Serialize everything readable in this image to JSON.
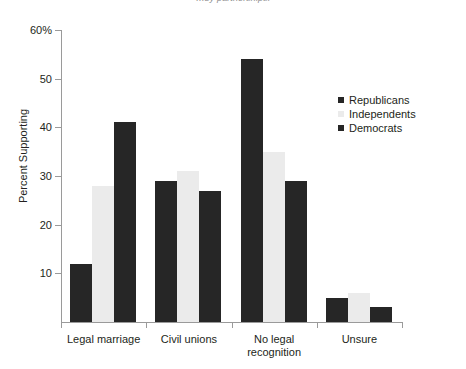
{
  "caption_fragment": "…by partnerships.",
  "chart_data": {
    "type": "bar",
    "title": "",
    "xlabel": "",
    "ylabel": "Percent Supporting",
    "ylim": [
      0,
      60
    ],
    "grid": false,
    "legend_position": "upper-right-inside",
    "categories": [
      "Legal marriage",
      "Civil unions",
      "No legal\nrecognition",
      "Unsure"
    ],
    "category_lines": [
      [
        "Legal marriage"
      ],
      [
        "Civil unions"
      ],
      [
        "No legal",
        "recognition"
      ],
      [
        "Unsure"
      ]
    ],
    "ytick_labels": [
      "60%",
      "50",
      "40",
      "30",
      "20",
      "10"
    ],
    "ytick_values": [
      60,
      50,
      40,
      30,
      20,
      10
    ],
    "series": [
      {
        "name": "Republicans",
        "color": "#262626",
        "values": [
          12,
          29,
          54,
          5
        ]
      },
      {
        "name": "Independents",
        "color": "#ebebeb",
        "values": [
          28,
          31,
          35,
          6
        ]
      },
      {
        "name": "Democrats",
        "color": "#262626",
        "values": [
          41,
          27,
          29,
          3
        ]
      }
    ]
  },
  "legend": {
    "items": [
      {
        "label": "Republicans",
        "swatch": "#262626"
      },
      {
        "label": "Independents",
        "swatch": "#ebebeb"
      },
      {
        "label": "Democrats",
        "swatch": "#262626"
      }
    ]
  },
  "colors": {
    "axis": "#9a9a9a",
    "text": "#231f20",
    "dark_series": "#262626",
    "light_series": "#ebebeb",
    "background": "#ffffff"
  }
}
